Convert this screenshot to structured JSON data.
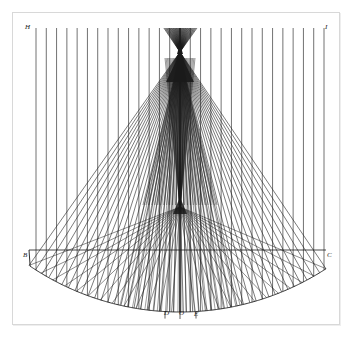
{
  "figure": {
    "title": "Perspective construction of a conic surface",
    "kind": "line-engraving geometric diagram",
    "background_color": "#ffffff",
    "ink_color": "#1a1a1a",
    "frame_color": "#d8d8d8"
  },
  "plate": {
    "frame": {
      "x": 12,
      "y": 12,
      "width": 328,
      "height": 313
    }
  },
  "labels": {
    "apex": "A",
    "top_left": "H",
    "top_right": "I",
    "left_vertex": "B",
    "right_vertex": "C",
    "baseline_left": "D",
    "baseline_center": "O",
    "baseline_right": "E"
  },
  "geometry": {
    "apex_point": {
      "x": 180,
      "y": 52
    },
    "node_point": {
      "x": 180,
      "y": 207
    },
    "left_vertex": {
      "x": 29,
      "y": 250
    },
    "right_vertex": {
      "x": 326,
      "y": 250
    },
    "arc": {
      "center_x": 180,
      "center_y": 44,
      "radius": 268,
      "start_x": 29,
      "start_y": 250,
      "end_x": 326,
      "end_y": 250,
      "bottom_y": 310
    },
    "chord_y": 250,
    "vertical_line_count": 29,
    "vertical_left_x": 36,
    "vertical_right_x": 324,
    "ray_count_left": 24,
    "ray_count_right": 24,
    "node_ray_count": 26,
    "top_y": 28,
    "stroke_width": 0.65
  },
  "chart_data": {
    "type": "line",
    "title": "Perspective construction of a conic surface",
    "xlabel": "",
    "ylabel": "",
    "annotations": [
      "A",
      "H",
      "I",
      "B",
      "C",
      "D",
      "O",
      "E"
    ],
    "series": [
      {
        "name": "vertical-generatrices",
        "values": [
          29
        ]
      },
      {
        "name": "apex-rays-left",
        "values": [
          24
        ]
      },
      {
        "name": "apex-rays-right",
        "values": [
          24
        ]
      },
      {
        "name": "node-rays",
        "values": [
          26
        ]
      },
      {
        "name": "base-arc",
        "values": [
          1
        ]
      },
      {
        "name": "chord",
        "values": [
          1
        ]
      }
    ]
  }
}
